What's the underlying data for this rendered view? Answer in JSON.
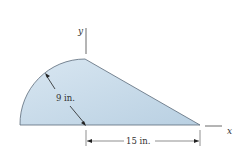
{
  "diagram": {
    "axes": {
      "x_label": "x",
      "y_label": "y"
    },
    "dimensions": {
      "radius_label": "9 in.",
      "base_label": "15 in."
    },
    "colors": {
      "fill": "#c9dcea",
      "stroke": "#555555"
    }
  }
}
